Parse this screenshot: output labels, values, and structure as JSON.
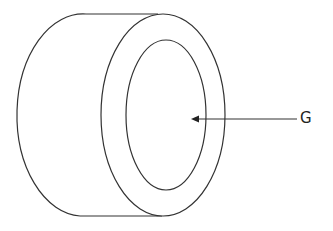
{
  "diagram": {
    "type": "cylinder-ring",
    "labels": [
      {
        "id": "G",
        "text": "G",
        "points_to": "inner-hollow-center"
      }
    ],
    "stroke_color": "#333333",
    "background": "#ffffff"
  }
}
